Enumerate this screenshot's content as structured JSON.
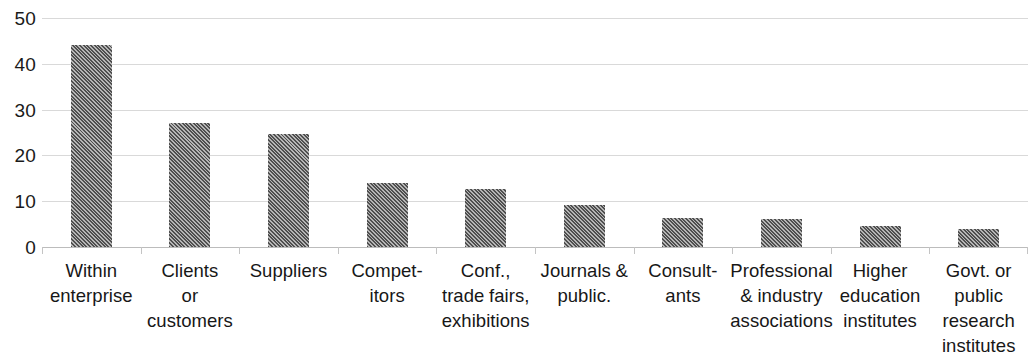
{
  "chart_data": {
    "type": "bar",
    "title": "",
    "subtitle": "",
    "xlabel": "",
    "ylabel": "",
    "ylim": [
      0,
      50
    ],
    "yticks": [
      0,
      10,
      20,
      30,
      40,
      50
    ],
    "grid": "horizontal",
    "legend": "none",
    "bar_color": "#4f4f4f",
    "bar_pattern": "diagonal-hatch",
    "categories": [
      "Within enterprise",
      "Clients or customers",
      "Suppliers",
      "Competitors",
      "Conf., trade fairs, exhibitions",
      "Journals & public.",
      "Consultants",
      "Professional & industry associations",
      "Higher education institutes",
      "Govt. or public research institutes"
    ],
    "category_label_lines": [
      [
        "Within",
        "enterprise"
      ],
      [
        "Clients",
        "or",
        "customers"
      ],
      [
        "Suppliers"
      ],
      [
        "Compet-",
        "itors"
      ],
      [
        "Conf.,",
        "trade fairs,",
        "exhibitions"
      ],
      [
        "Journals &",
        "public."
      ],
      [
        "Consult-",
        "ants"
      ],
      [
        "Professional",
        "& industry",
        "associations"
      ],
      [
        "Higher",
        "education",
        "institutes"
      ],
      [
        "Govt. or",
        "public",
        "research",
        "institutes"
      ]
    ],
    "values": [
      44,
      27,
      24.7,
      13.9,
      12.7,
      9.1,
      6.4,
      6.2,
      4.5,
      3.9
    ]
  },
  "axis": {
    "y_tick_labels": [
      "50",
      "40",
      "30",
      "20",
      "10",
      "0"
    ]
  }
}
